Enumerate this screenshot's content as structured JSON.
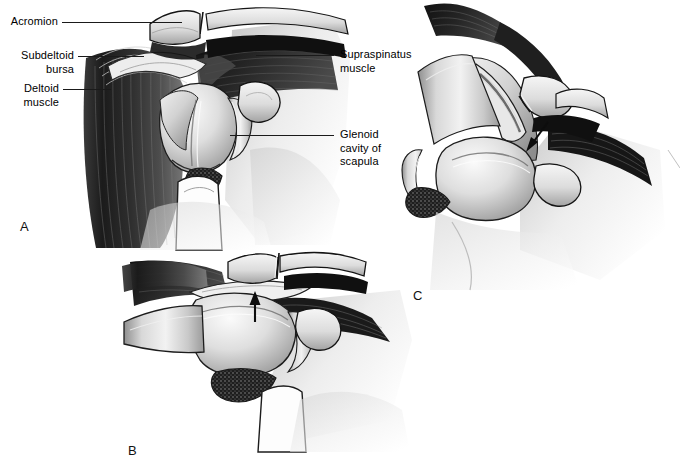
{
  "figure": {
    "kind": "anatomical-illustration",
    "style": "grayscale medical airbrush line art",
    "background_color": "#ffffff",
    "ink_color": "#1a1a1a",
    "width": 680,
    "height": 471
  },
  "labels": {
    "acromion": "Acromion",
    "subdeltoid_bursa": "Subdeltoid\nbursa",
    "deltoid_muscle": "Deltoid\nmuscle",
    "supraspinatus_muscle": "Supraspinatus\nmuscle",
    "glenoid_cavity": "Glenoid\ncavity of\nscapula"
  },
  "panels": [
    {
      "id": "A",
      "letter": "A",
      "x": 20,
      "y": 219
    },
    {
      "id": "B",
      "letter": "B",
      "x": 128,
      "y": 443
    },
    {
      "id": "C",
      "letter": "C",
      "x": 413,
      "y": 288
    }
  ],
  "arrows": [
    {
      "panel": "B",
      "direction": "up",
      "meaning": "impingement-direction"
    },
    {
      "panel": "C",
      "direction": "down-left",
      "meaning": "impingement-direction"
    }
  ]
}
